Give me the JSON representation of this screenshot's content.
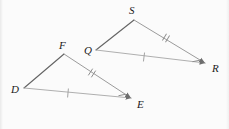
{
  "figure": {
    "background_color": "#fbfbfb",
    "stroke_color": "#9a9a9a",
    "dark_stroke_color": "#6e6e6e",
    "label_color": "#1a1a1a",
    "triangles": [
      {
        "name": "triangle-DFE",
        "vertices": [
          {
            "label": "D",
            "x": 24,
            "y": 88,
            "label_x": 11,
            "label_y": 93
          },
          {
            "label": "F",
            "x": 64,
            "y": 54,
            "label_x": 60,
            "label_y": 49
          },
          {
            "label": "E",
            "x": 133,
            "y": 99,
            "label_x": 138,
            "label_y": 108
          }
        ],
        "sides": [
          {
            "name": "side-DF",
            "from": "D",
            "to": "F",
            "ticks": 0
          },
          {
            "name": "side-FE",
            "from": "F",
            "to": "E",
            "ticks": 2
          },
          {
            "name": "side-DE",
            "from": "D",
            "to": "E",
            "ticks": 1
          }
        ],
        "arrow_at": "E"
      },
      {
        "name": "triangle-QSR",
        "vertices": [
          {
            "label": "Q",
            "x": 96,
            "y": 50,
            "label_x": 85,
            "label_y": 53
          },
          {
            "label": "S",
            "x": 134,
            "y": 19,
            "label_x": 129,
            "label_y": 14
          },
          {
            "label": "R",
            "x": 207,
            "y": 64,
            "label_x": 212,
            "label_y": 72
          }
        ],
        "sides": [
          {
            "name": "side-QS",
            "from": "Q",
            "to": "S",
            "ticks": 0
          },
          {
            "name": "side-SR",
            "from": "S",
            "to": "R",
            "ticks": 2
          },
          {
            "name": "side-QR",
            "from": "Q",
            "to": "R",
            "ticks": 1
          }
        ],
        "arrow_at": "R"
      }
    ],
    "tick_marks": [
      {
        "name": "tick-FE-double",
        "x": 92,
        "y": 73,
        "count": 2,
        "angle": 38
      },
      {
        "name": "tick-DE-single",
        "x": 68,
        "y": 93,
        "count": 1,
        "angle": 5
      },
      {
        "name": "tick-E-corner-single",
        "x": 122,
        "y": 95,
        "count": 1,
        "angle": 70
      },
      {
        "name": "tick-SR-double",
        "x": 166,
        "y": 38,
        "count": 2,
        "angle": 30
      },
      {
        "name": "tick-QR-single",
        "x": 144,
        "y": 57,
        "count": 1,
        "angle": 5
      },
      {
        "name": "tick-R-corner-single",
        "x": 196,
        "y": 61,
        "count": 1,
        "angle": 70
      }
    ],
    "labels": {
      "D": "D",
      "F": "F",
      "E": "E",
      "Q": "Q",
      "S": "S",
      "R": "R"
    }
  }
}
